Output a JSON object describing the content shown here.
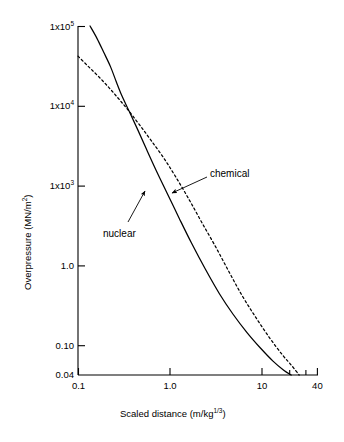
{
  "chart_data": {
    "type": "line",
    "title": "",
    "xlabel": "Scaled distance (m/kg",
    "xlabel_sup": "1/3",
    "xlabel_tail": ")",
    "ylabel": "Overpressure (MN/m",
    "ylabel_sup": "2",
    "ylabel_tail": ")",
    "xscale": "log",
    "yscale": "log",
    "xlim": [
      0.1,
      40
    ],
    "ylim": [
      0.04,
      100000
    ],
    "grid": false,
    "legend": "annotations",
    "xticks": [
      {
        "value": 0.1,
        "label": "0.1",
        "major": true
      },
      {
        "value": 0.2,
        "label": "",
        "major": false
      },
      {
        "value": 0.4,
        "label": "",
        "major": false
      },
      {
        "value": 1.0,
        "label": "1.0",
        "major": true
      },
      {
        "value": 4.0,
        "label": "",
        "major": false
      },
      {
        "value": 10,
        "label": "10",
        "major": true
      },
      {
        "value": 20,
        "label": "",
        "major": false
      },
      {
        "value": 30,
        "label": "",
        "major": false
      },
      {
        "value": 40,
        "label": "40",
        "major": true
      }
    ],
    "yticks": [
      {
        "value": 100000,
        "label": "1x10",
        "sup": "5"
      },
      {
        "value": 10000,
        "label": "1x10",
        "sup": "4"
      },
      {
        "value": 1000,
        "label": "1x10",
        "sup": "3"
      },
      {
        "value": 1.0,
        "label": "1.0",
        "sup": ""
      },
      {
        "value": 0.1,
        "label": "0.10",
        "sup": ""
      },
      {
        "value": 0.04,
        "label": "0.04",
        "sup": ""
      }
    ],
    "series": [
      {
        "name": "nuclear",
        "style": "solid",
        "color": "#000000",
        "points": [
          [
            0.135,
            100000
          ],
          [
            0.16,
            60000
          ],
          [
            0.19,
            33000
          ],
          [
            0.225,
            18000
          ],
          [
            0.26,
            9500
          ],
          [
            0.3,
            5200
          ],
          [
            0.36,
            2700
          ],
          [
            0.44,
            1300
          ],
          [
            0.55,
            560
          ],
          [
            0.7,
            230
          ],
          [
            0.92,
            88
          ],
          [
            1.25,
            30
          ],
          [
            1.7,
            10.5
          ],
          [
            2.4,
            3.5
          ],
          [
            3.4,
            1.25
          ],
          [
            4.8,
            0.52
          ],
          [
            6.8,
            0.24
          ],
          [
            9.5,
            0.125
          ],
          [
            13.0,
            0.072
          ],
          [
            17.0,
            0.049
          ],
          [
            20.5,
            0.04
          ]
        ]
      },
      {
        "name": "chemical",
        "style": "dashed",
        "color": "#000000",
        "points": [
          [
            0.1,
            28000
          ],
          [
            0.13,
            18000
          ],
          [
            0.17,
            11500
          ],
          [
            0.22,
            7200
          ],
          [
            0.28,
            4500
          ],
          [
            0.36,
            2700
          ],
          [
            0.47,
            1500
          ],
          [
            0.62,
            800
          ],
          [
            0.85,
            380
          ],
          [
            1.15,
            170
          ],
          [
            1.6,
            66
          ],
          [
            2.2,
            25
          ],
          [
            3.1,
            9.0
          ],
          [
            4.3,
            3.2
          ],
          [
            6.0,
            1.15
          ],
          [
            8.5,
            0.45
          ],
          [
            12.0,
            0.19
          ],
          [
            16.5,
            0.093
          ],
          [
            21.0,
            0.058
          ],
          [
            25.0,
            0.04
          ]
        ]
      }
    ],
    "annotations": [
      {
        "name": "chemical",
        "text": "chemical",
        "label_x": 210,
        "label_y": 168,
        "arrow_from": [
          207,
          177
        ],
        "arrow_to": [
          172,
          193
        ]
      },
      {
        "name": "nuclear",
        "text": "nuclear",
        "label_x": 103,
        "label_y": 228,
        "arrow_from": [
          128,
          222
        ],
        "arrow_to": [
          145,
          191
        ]
      }
    ]
  }
}
